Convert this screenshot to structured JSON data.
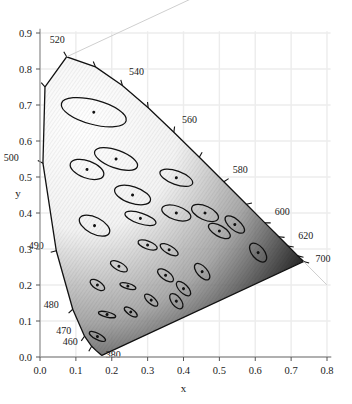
{
  "chart_data": {
    "type": "scatter",
    "title": "",
    "xlabel": "x",
    "ylabel": "y",
    "xlim": [
      0.0,
      0.8
    ],
    "ylim": [
      0.0,
      0.9
    ],
    "grid": true,
    "legend": "none",
    "xticks": [
      "0.0",
      "0.1",
      "0.2",
      "0.3",
      "0.4",
      "0.5",
      "0.6",
      "0.7",
      "0.8"
    ],
    "xtickvals": [
      0.0,
      0.1,
      0.2,
      0.3,
      0.4,
      0.5,
      0.6,
      0.7,
      0.8
    ],
    "yticks": [
      "0.0",
      "0.1",
      "0.2",
      "0.3",
      "0.4",
      "0.5",
      "0.6",
      "0.7",
      "0.8",
      "0.9"
    ],
    "ytickvals": [
      0.0,
      0.1,
      0.2,
      0.3,
      0.4,
      0.5,
      0.6,
      0.7,
      0.8,
      0.9
    ],
    "annotations": [
      {
        "label": "520",
        "x": 0.074,
        "y": 0.834,
        "tx": -0.026,
        "ty": 0.038
      },
      {
        "label": "540",
        "x": 0.229,
        "y": 0.754,
        "tx": 0.04,
        "ty": 0.03
      },
      {
        "label": "560",
        "x": 0.373,
        "y": 0.624,
        "tx": 0.044,
        "ty": 0.026
      },
      {
        "label": "580",
        "x": 0.512,
        "y": 0.487,
        "tx": 0.046,
        "ty": 0.024
      },
      {
        "label": "600",
        "x": 0.627,
        "y": 0.373,
        "tx": 0.048,
        "ty": 0.022
      },
      {
        "label": "620",
        "x": 0.691,
        "y": 0.308,
        "tx": 0.05,
        "ty": 0.02
      },
      {
        "label": "700",
        "x": 0.734,
        "y": 0.265,
        "tx": 0.055,
        "ty": -0.002
      },
      {
        "label": "500",
        "x": 0.0082,
        "y": 0.538,
        "tx": -0.088,
        "ty": 0.006
      },
      {
        "label": "490",
        "x": 0.0454,
        "y": 0.295,
        "tx": -0.056,
        "ty": 0.004
      },
      {
        "label": "480",
        "x": 0.0913,
        "y": 0.133,
        "tx": -0.06,
        "ty": 0.004
      },
      {
        "label": "470",
        "x": 0.1241,
        "y": 0.058,
        "tx": -0.058,
        "ty": 0.006
      },
      {
        "label": "460",
        "x": 0.144,
        "y": 0.03,
        "tx": -0.06,
        "ty": 0.004
      },
      {
        "label": "380",
        "x": 0.1741,
        "y": 0.005,
        "tx": 0.03,
        "ty": -0.008
      }
    ],
    "spectral_tick_waves": [
      460,
      470,
      480,
      490,
      500,
      510,
      520,
      530,
      540,
      550,
      560,
      570,
      580,
      590,
      600,
      610,
      620,
      640,
      700
    ],
    "ellipses": [
      {
        "cx": 0.16,
        "cy": 0.057,
        "rx": 0.0085,
        "ry": 0.025,
        "angle": 62
      },
      {
        "cx": 0.187,
        "cy": 0.118,
        "rx": 0.0072,
        "ry": 0.0245,
        "angle": 77
      },
      {
        "cx": 0.253,
        "cy": 0.125,
        "rx": 0.0083,
        "ry": 0.021,
        "angle": 55
      },
      {
        "cx": 0.15,
        "cy": 0.68,
        "rx": 0.034,
        "ry": 0.093,
        "angle": 75
      },
      {
        "cx": 0.131,
        "cy": 0.521,
        "rx": 0.024,
        "ry": 0.049,
        "angle": 70
      },
      {
        "cx": 0.212,
        "cy": 0.55,
        "rx": 0.025,
        "ry": 0.063,
        "angle": 70
      },
      {
        "cx": 0.258,
        "cy": 0.45,
        "rx": 0.023,
        "ry": 0.052,
        "angle": 72
      },
      {
        "cx": 0.152,
        "cy": 0.365,
        "rx": 0.023,
        "ry": 0.046,
        "angle": 63
      },
      {
        "cx": 0.28,
        "cy": 0.385,
        "rx": 0.015,
        "ry": 0.045,
        "angle": 72
      },
      {
        "cx": 0.38,
        "cy": 0.498,
        "rx": 0.019,
        "ry": 0.048,
        "angle": 70
      },
      {
        "cx": 0.38,
        "cy": 0.4,
        "rx": 0.019,
        "ry": 0.042,
        "angle": 72
      },
      {
        "cx": 0.46,
        "cy": 0.4,
        "rx": 0.019,
        "ry": 0.04,
        "angle": 66
      },
      {
        "cx": 0.3,
        "cy": 0.311,
        "rx": 0.011,
        "ry": 0.028,
        "angle": 70
      },
      {
        "cx": 0.36,
        "cy": 0.298,
        "rx": 0.011,
        "ry": 0.028,
        "angle": 60
      },
      {
        "cx": 0.5,
        "cy": 0.35,
        "rx": 0.015,
        "ry": 0.034,
        "angle": 60
      },
      {
        "cx": 0.543,
        "cy": 0.368,
        "rx": 0.015,
        "ry": 0.033,
        "angle": 50
      },
      {
        "cx": 0.608,
        "cy": 0.29,
        "rx": 0.017,
        "ry": 0.031,
        "angle": 40
      },
      {
        "cx": 0.22,
        "cy": 0.252,
        "rx": 0.011,
        "ry": 0.026,
        "angle": 62
      },
      {
        "cx": 0.16,
        "cy": 0.2,
        "rx": 0.011,
        "ry": 0.023,
        "angle": 57
      },
      {
        "cx": 0.245,
        "cy": 0.197,
        "rx": 0.0075,
        "ry": 0.023,
        "angle": 73
      },
      {
        "cx": 0.35,
        "cy": 0.227,
        "rx": 0.012,
        "ry": 0.026,
        "angle": 54
      },
      {
        "cx": 0.452,
        "cy": 0.237,
        "rx": 0.014,
        "ry": 0.028,
        "angle": 42
      },
      {
        "cx": 0.31,
        "cy": 0.158,
        "rx": 0.01,
        "ry": 0.023,
        "angle": 49
      },
      {
        "cx": 0.4,
        "cy": 0.19,
        "rx": 0.012,
        "ry": 0.0255,
        "angle": 45
      },
      {
        "cx": 0.38,
        "cy": 0.155,
        "rx": 0.013,
        "ry": 0.025,
        "angle": 38
      }
    ],
    "spectral_locus": [
      {
        "w": 380,
        "x": 0.1741,
        "y": 0.005
      },
      {
        "w": 390,
        "x": 0.1738,
        "y": 0.0049
      },
      {
        "w": 400,
        "x": 0.1733,
        "y": 0.0048
      },
      {
        "w": 410,
        "x": 0.1726,
        "y": 0.0048
      },
      {
        "w": 420,
        "x": 0.1714,
        "y": 0.0051
      },
      {
        "w": 430,
        "x": 0.1689,
        "y": 0.0069
      },
      {
        "w": 440,
        "x": 0.1644,
        "y": 0.0109
      },
      {
        "w": 450,
        "x": 0.1566,
        "y": 0.0177
      },
      {
        "w": 460,
        "x": 0.144,
        "y": 0.0297
      },
      {
        "w": 470,
        "x": 0.1241,
        "y": 0.0578
      },
      {
        "w": 480,
        "x": 0.0913,
        "y": 0.1327
      },
      {
        "w": 490,
        "x": 0.0454,
        "y": 0.295
      },
      {
        "w": 500,
        "x": 0.0082,
        "y": 0.5384
      },
      {
        "w": 510,
        "x": 0.0139,
        "y": 0.7502
      },
      {
        "w": 520,
        "x": 0.0743,
        "y": 0.8338
      },
      {
        "w": 530,
        "x": 0.1547,
        "y": 0.8059
      },
      {
        "w": 540,
        "x": 0.2296,
        "y": 0.7543
      },
      {
        "w": 550,
        "x": 0.3016,
        "y": 0.6923
      },
      {
        "w": 560,
        "x": 0.3731,
        "y": 0.6245
      },
      {
        "w": 570,
        "x": 0.4441,
        "y": 0.5547
      },
      {
        "w": 580,
        "x": 0.5125,
        "y": 0.4866
      },
      {
        "w": 590,
        "x": 0.5752,
        "y": 0.4242
      },
      {
        "w": 600,
        "x": 0.627,
        "y": 0.3725
      },
      {
        "w": 610,
        "x": 0.6658,
        "y": 0.334
      },
      {
        "w": 620,
        "x": 0.6915,
        "y": 0.3083
      },
      {
        "w": 630,
        "x": 0.7079,
        "y": 0.292
      },
      {
        "w": 640,
        "x": 0.719,
        "y": 0.2809
      },
      {
        "w": 650,
        "x": 0.726,
        "y": 0.274
      },
      {
        "w": 660,
        "x": 0.73,
        "y": 0.27
      },
      {
        "w": 680,
        "x": 0.7334,
        "y": 0.2666
      },
      {
        "w": 700,
        "x": 0.7347,
        "y": 0.2653
      }
    ]
  }
}
